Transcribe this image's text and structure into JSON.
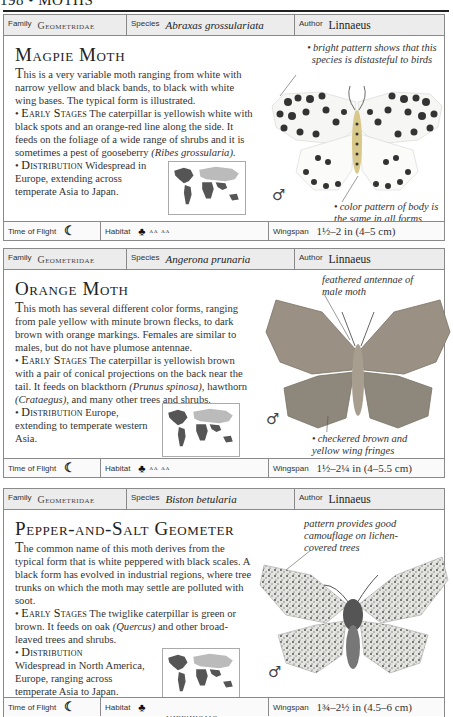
{
  "page": {
    "number": "198",
    "separator": "•",
    "section": "MOTHS"
  },
  "labels": {
    "family": "Family",
    "species": "Species",
    "author": "Author",
    "time_of_flight": "Time of Flight",
    "habitat": "Habitat",
    "wingspan": "Wingspan",
    "early_stages": "Early Stages",
    "distribution": "Distribution"
  },
  "icons": {
    "moon": "☾",
    "tree": "♣",
    "shrub": "ʌʌ ʌʌ",
    "male": "♂"
  },
  "entries": [
    {
      "family": "Geometridae",
      "species": "Abraxas grossulariata",
      "author": "Linnaeus",
      "title": "Magpie Moth",
      "intro_first": "T",
      "intro": "his is a very variable moth ranging from white with narrow yellow and black bands, to black with white wing bases. The typical form is illustrated.",
      "early_stages_a": "The caterpillar is yellowish white with black spots and an orange-red line along the side. It feeds on the foliage of a wide range of shrubs and it is sometimes a pest of gooseberry",
      "early_stages_latin": "(Ribes grossularia).",
      "distribution": "Widespread in Europe, extending across temperate Asia to Japan.",
      "region": "PALEARCTIC",
      "caption_top": "bright pattern shows that this species is distasteful to birds",
      "caption_bottom": "color pattern of body is the same in all forms",
      "time_of_flight_icon": "moon",
      "habitat_icons": [
        "tree",
        "shrub"
      ],
      "wingspan": "1½–2 in (4–5 cm)"
    },
    {
      "family": "Geometridae",
      "species": "Angerona prunaria",
      "author": "Linnaeus",
      "title": "Orange Moth",
      "intro_first": "T",
      "intro": "his moth has several different color forms, ranging from pale yellow with minute brown flecks, to dark brown with orange markings. Females are similar to males, but do not have plumose antennae.",
      "early_stages_a": "The caterpillar is yellowish brown with a pair of conical projections on the back near the tail. It feeds on blackthorn",
      "early_stages_latin": "(Prunus spinosa),",
      "early_stages_b": "hawthorn",
      "early_stages_latin2": "(Crataegus),",
      "early_stages_c": "and many other trees and shrubs.",
      "distribution": "Europe, extending to temperate western Asia.",
      "region": "PALEARCTIC",
      "caption_top": "feathered antennae of male moth",
      "caption_bottom": "checkered brown and yellow wing fringes",
      "time_of_flight_icon": "moon",
      "habitat_icons": [
        "tree",
        "shrub"
      ],
      "wingspan": "1½–2¼ in (4–5.5 cm)"
    },
    {
      "family": "Geometridae",
      "species": "Biston betularia",
      "author": "Linnaeus",
      "title": "Pepper-and-Salt Geometer",
      "intro_first": "T",
      "intro": "he common name of this moth derives from the typical form that is white peppered with black scales. A black form has evolved in industrial regions, where tree trunks on which the moth may settle are polluted with soot.",
      "early_stages_a": "The twiglike caterpillar is green or brown. It feeds on oak",
      "early_stages_latin": "(Quercus)",
      "early_stages_b": "and other broad-leaved trees and shrubs.",
      "distribution": "Widespread in North America, Europe, ranging across temperate Asia to Japan.",
      "region": "PALEARCTIC",
      "caption_top": "pattern provides good camouflage on lichen-covered trees",
      "time_of_flight_icon": "moon",
      "habitat_icons": [
        "tree"
      ],
      "wingspan": "1¾–2½ in (4.5–6 cm)"
    }
  ]
}
